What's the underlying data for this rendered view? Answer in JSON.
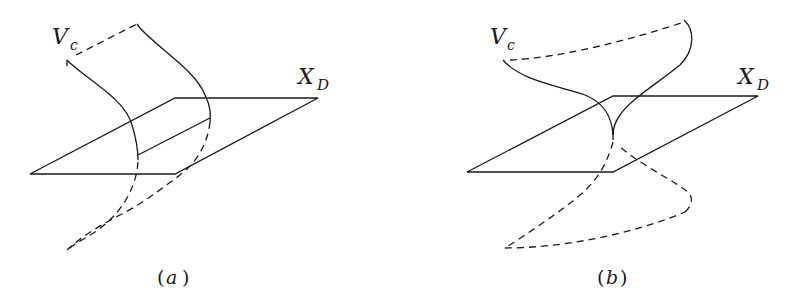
{
  "panels": [
    {
      "id": "a",
      "caption": "(a)",
      "caption_open": "(",
      "caption_letter": "a",
      "caption_close": ")",
      "surface_label": "V",
      "surface_sub": "c",
      "plane_label": "X",
      "plane_sub": "D"
    },
    {
      "id": "b",
      "caption": "(b)",
      "caption_open": "(",
      "caption_letter": "b",
      "caption_close": ")",
      "surface_label": "V",
      "surface_sub": "c",
      "plane_label": "X",
      "plane_sub": "D"
    }
  ],
  "colors": {
    "stroke": "#1a1a1a",
    "background": "#ffffff"
  }
}
